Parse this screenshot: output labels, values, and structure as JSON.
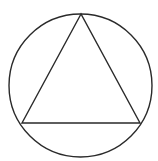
{
  "diagram": {
    "background": "#ffffff",
    "stroke_color": "#2a2a2a",
    "stroke_width": 1.4,
    "circle": {
      "cx": 80.5,
      "cy": 85.5,
      "r": 71.5
    },
    "triangle": {
      "points": "81,14 22,123 140,123"
    }
  }
}
